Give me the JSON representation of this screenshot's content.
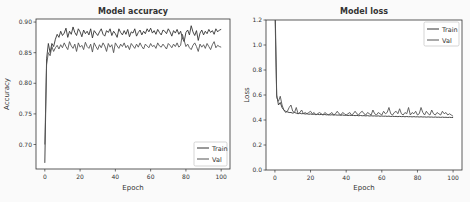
{
  "chart_data": [
    {
      "type": "line",
      "title": "Model accuracy",
      "xlabel": "Epoch",
      "ylabel": "Accuracy",
      "xlim": [
        -5,
        105
      ],
      "ylim": [
        0.66,
        0.905
      ],
      "xticks": [
        0,
        20,
        40,
        60,
        80,
        100
      ],
      "yticks": [
        0.7,
        0.75,
        0.8,
        0.85,
        0.9
      ],
      "ytick_labels": [
        "0.70",
        "0.75",
        "0.80",
        "0.85",
        "0.90"
      ],
      "grid": false,
      "legend": {
        "position": "lower right",
        "entries": [
          "Train",
          "Val"
        ]
      },
      "series": [
        {
          "name": "Train",
          "color": "#333333",
          "values": [
            0.67,
            0.84,
            0.865,
            0.85,
            0.865,
            0.86,
            0.872,
            0.88,
            0.875,
            0.885,
            0.878,
            0.882,
            0.89,
            0.875,
            0.885,
            0.88,
            0.892,
            0.883,
            0.878,
            0.889,
            0.884,
            0.876,
            0.887,
            0.881,
            0.885,
            0.879,
            0.889,
            0.874,
            0.886,
            0.882,
            0.878,
            0.884,
            0.889,
            0.88,
            0.877,
            0.886,
            0.883,
            0.889,
            0.878,
            0.885,
            0.881,
            0.875,
            0.889,
            0.883,
            0.879,
            0.886,
            0.88,
            0.888,
            0.876,
            0.884,
            0.882,
            0.889,
            0.877,
            0.883,
            0.887,
            0.879,
            0.885,
            0.881,
            0.889,
            0.884,
            0.89,
            0.882,
            0.886,
            0.88,
            0.888,
            0.883,
            0.879,
            0.887,
            0.885,
            0.881,
            0.889,
            0.884,
            0.877,
            0.886,
            0.882,
            0.888,
            0.88,
            0.885,
            0.874,
            0.868,
            0.883,
            0.887,
            0.879,
            0.894,
            0.884,
            0.878,
            0.886,
            0.87,
            0.882,
            0.887,
            0.879,
            0.885,
            0.881,
            0.888,
            0.883,
            0.886,
            0.88,
            0.889,
            0.884,
            0.887,
            0.888
          ]
        },
        {
          "name": "Val",
          "color": "#555555",
          "values": [
            0.7,
            0.83,
            0.85,
            0.845,
            0.86,
            0.852,
            0.858,
            0.862,
            0.856,
            0.863,
            0.858,
            0.866,
            0.86,
            0.855,
            0.868,
            0.861,
            0.857,
            0.864,
            0.852,
            0.866,
            0.859,
            0.862,
            0.855,
            0.867,
            0.86,
            0.857,
            0.864,
            0.851,
            0.866,
            0.86,
            0.855,
            0.863,
            0.858,
            0.866,
            0.861,
            0.852,
            0.865,
            0.859,
            0.863,
            0.85,
            0.866,
            0.861,
            0.857,
            0.864,
            0.86,
            0.866,
            0.858,
            0.862,
            0.855,
            0.865,
            0.861,
            0.857,
            0.864,
            0.859,
            0.866,
            0.86,
            0.856,
            0.864,
            0.861,
            0.858,
            0.865,
            0.86,
            0.862,
            0.857,
            0.866,
            0.861,
            0.859,
            0.864,
            0.86,
            0.856,
            0.865,
            0.862,
            0.858,
            0.864,
            0.86,
            0.866,
            0.859,
            0.862,
            0.88,
            0.87,
            0.86,
            0.864,
            0.858,
            0.855,
            0.862,
            0.866,
            0.86,
            0.852,
            0.864,
            0.859,
            0.863,
            0.857,
            0.865,
            0.86,
            0.855,
            0.863,
            0.868,
            0.858,
            0.862,
            0.86,
            0.859
          ]
        }
      ]
    },
    {
      "type": "line",
      "title": "Model loss",
      "xlabel": "Epoch",
      "ylabel": "Loss",
      "xlim": [
        -5,
        105
      ],
      "ylim": [
        0.0,
        1.2
      ],
      "xticks": [
        0,
        20,
        40,
        60,
        80,
        100
      ],
      "yticks": [
        0.0,
        0.2,
        0.4,
        0.6,
        0.8,
        1.0,
        1.2
      ],
      "ytick_labels": [
        "0.0",
        "0.2",
        "0.4",
        "0.6",
        "0.8",
        "1.0",
        "1.2"
      ],
      "grid": false,
      "legend": {
        "position": "upper right",
        "entries": [
          "Train",
          "Val"
        ]
      },
      "series": [
        {
          "name": "Train",
          "color": "#333333",
          "values": [
            1.4,
            0.6,
            0.52,
            0.54,
            0.5,
            0.48,
            0.47,
            0.465,
            0.46,
            0.46,
            0.455,
            0.46,
            0.455,
            0.45,
            0.455,
            0.45,
            0.452,
            0.448,
            0.45,
            0.446,
            0.448,
            0.445,
            0.447,
            0.444,
            0.446,
            0.443,
            0.445,
            0.442,
            0.444,
            0.441,
            0.443,
            0.44,
            0.442,
            0.44,
            0.441,
            0.439,
            0.44,
            0.438,
            0.44,
            0.437,
            0.439,
            0.436,
            0.438,
            0.436,
            0.437,
            0.435,
            0.437,
            0.434,
            0.436,
            0.434,
            0.435,
            0.433,
            0.435,
            0.432,
            0.434,
            0.432,
            0.433,
            0.431,
            0.433,
            0.43,
            0.432,
            0.43,
            0.431,
            0.429,
            0.431,
            0.428,
            0.43,
            0.428,
            0.429,
            0.427,
            0.429,
            0.427,
            0.428,
            0.426,
            0.428,
            0.426,
            0.427,
            0.425,
            0.427,
            0.425,
            0.426,
            0.424,
            0.426,
            0.424,
            0.425,
            0.423,
            0.425,
            0.423,
            0.424,
            0.422,
            0.424,
            0.422,
            0.423,
            0.421,
            0.423,
            0.421,
            0.422,
            0.42,
            0.422,
            0.42,
            0.42
          ]
        },
        {
          "name": "Val",
          "color": "#555555",
          "values": [
            1.3,
            0.58,
            0.55,
            0.59,
            0.52,
            0.48,
            0.46,
            0.47,
            0.5,
            0.52,
            0.47,
            0.46,
            0.5,
            0.45,
            0.46,
            0.48,
            0.45,
            0.46,
            0.45,
            0.46,
            0.47,
            0.45,
            0.46,
            0.44,
            0.45,
            0.46,
            0.45,
            0.44,
            0.46,
            0.45,
            0.44,
            0.45,
            0.46,
            0.44,
            0.45,
            0.47,
            0.45,
            0.44,
            0.46,
            0.45,
            0.44,
            0.45,
            0.46,
            0.44,
            0.45,
            0.47,
            0.45,
            0.44,
            0.46,
            0.47,
            0.45,
            0.44,
            0.46,
            0.45,
            0.44,
            0.48,
            0.45,
            0.44,
            0.46,
            0.45,
            0.44,
            0.47,
            0.45,
            0.46,
            0.5,
            0.45,
            0.44,
            0.46,
            0.47,
            0.45,
            0.49,
            0.45,
            0.44,
            0.46,
            0.45,
            0.5,
            0.44,
            0.46,
            0.45,
            0.47,
            0.44,
            0.45,
            0.5,
            0.46,
            0.44,
            0.47,
            0.45,
            0.44,
            0.48,
            0.45,
            0.44,
            0.46,
            0.45,
            0.44,
            0.47,
            0.45,
            0.46,
            0.44,
            0.45,
            0.44,
            0.43
          ]
        }
      ]
    }
  ],
  "charts": {
    "left": {
      "title": "Model accuracy",
      "xlabel": "Epoch",
      "ylabel": "Accuracy",
      "legend_train": "Train",
      "legend_val": "Val"
    },
    "right": {
      "title": "Model loss",
      "xlabel": "Epoch",
      "ylabel": "Loss",
      "legend_train": "Train",
      "legend_val": "Val"
    }
  }
}
